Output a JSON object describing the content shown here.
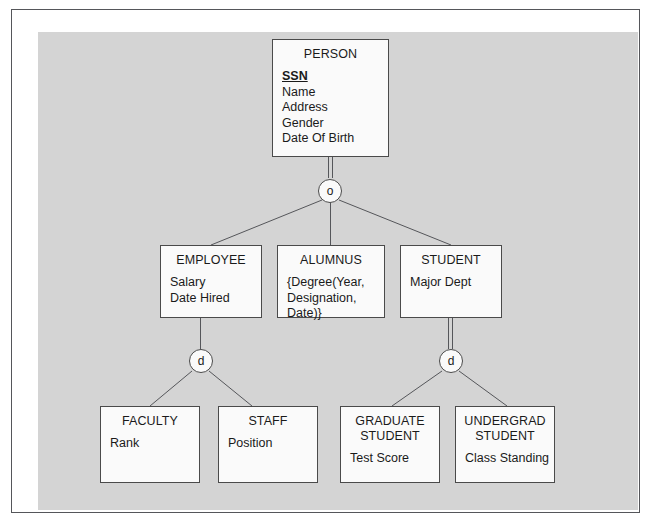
{
  "diagram": {
    "type": "er-specialization-diagram",
    "background_color": "#d4d4d4",
    "page_color": "#ffffff",
    "entity_fill": "#fafafa",
    "line_color": "#4a4a4a",
    "entities": [
      {
        "id": "person",
        "name": "PERSON",
        "attributes": [
          {
            "text": "SSN",
            "key": true
          },
          {
            "text": "Name",
            "key": false
          },
          {
            "text": "Address",
            "key": false
          },
          {
            "text": "Gender",
            "key": false
          },
          {
            "text": "Date Of Birth",
            "key": false
          }
        ]
      },
      {
        "id": "employee",
        "name": "EMPLOYEE",
        "attributes": [
          {
            "text": "Salary",
            "key": false
          },
          {
            "text": "Date Hired",
            "key": false
          }
        ]
      },
      {
        "id": "alumnus",
        "name": "ALUMNUS",
        "attributes": [
          {
            "text": "{Degree(Year,",
            "key": false
          },
          {
            "text": "Designation,",
            "key": false
          },
          {
            "text": "Date)}",
            "key": false
          }
        ]
      },
      {
        "id": "student",
        "name": "STUDENT",
        "attributes": [
          {
            "text": "Major Dept",
            "key": false
          }
        ]
      },
      {
        "id": "faculty",
        "name": "FACULTY",
        "attributes": [
          {
            "text": "Rank",
            "key": false
          }
        ]
      },
      {
        "id": "staff",
        "name": "STAFF",
        "attributes": [
          {
            "text": "Position",
            "key": false
          }
        ]
      },
      {
        "id": "graduate_student",
        "name": "GRADUATE\nSTUDENT",
        "attributes": [
          {
            "text": "Test Score",
            "key": false
          }
        ]
      },
      {
        "id": "undergrad_student",
        "name": "UNDERGRAD\nSTUDENT",
        "attributes": [
          {
            "text": "Class Standing",
            "key": false
          }
        ]
      }
    ],
    "specializations": [
      {
        "id": "person-spec",
        "symbol": "o",
        "meaning": "overlapping",
        "parent": "person",
        "parent_line": "double",
        "children": [
          "employee",
          "alumnus",
          "student"
        ]
      },
      {
        "id": "employee-spec",
        "symbol": "d",
        "meaning": "disjoint",
        "parent": "employee",
        "parent_line": "single",
        "children": [
          "faculty",
          "staff"
        ]
      },
      {
        "id": "student-spec",
        "symbol": "d",
        "meaning": "disjoint",
        "parent": "student",
        "parent_line": "double",
        "children": [
          "graduate_student",
          "undergrad_student"
        ]
      }
    ]
  }
}
